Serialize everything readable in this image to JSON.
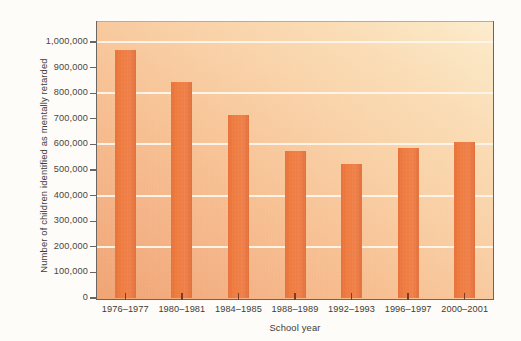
{
  "chart_data": {
    "type": "bar",
    "title": "",
    "xlabel": "School year",
    "ylabel": "Number of children identified as mentally retarded",
    "categories": [
      "1976–1977",
      "1980–1981",
      "1984–1985",
      "1988–1989",
      "1992–1993",
      "1996–1997",
      "2000–2001"
    ],
    "values": [
      970000,
      845000,
      715000,
      575000,
      522000,
      585000,
      610000
    ],
    "ylim": [
      0,
      1050000
    ],
    "ytick_values": [
      0,
      100000,
      200000,
      300000,
      400000,
      500000,
      600000,
      700000,
      800000,
      900000,
      1000000
    ],
    "ytick_labels": [
      "0",
      "100,000",
      "200,000",
      "300,000",
      "400,000",
      "500,000",
      "600,000",
      "700,000",
      "800,000",
      "900,000",
      "1,000,000"
    ],
    "gridline_values": [
      200000,
      400000,
      600000,
      800000,
      1000000
    ],
    "grid": true,
    "legend": false,
    "series": [
      {
        "name": "Children identified as mentally retarded",
        "values": [
          970000,
          845000,
          715000,
          575000,
          522000,
          585000,
          610000
        ]
      }
    ],
    "colors": {
      "bar": "#ed7b3e",
      "gridline": "#fdf6ec",
      "axis": "#6b6560",
      "text": "#3f3b37",
      "plot_bg_low": "#f0a372",
      "plot_bg_high": "#fcecce",
      "figure_bg": "#fdfcf8"
    }
  }
}
